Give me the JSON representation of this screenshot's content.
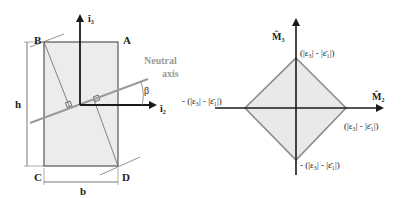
{
  "left_figure": {
    "corners": {
      "A": "A",
      "B": "B",
      "C": "C",
      "D": "D"
    },
    "dimension_h": "h",
    "dimension_b": "b",
    "axis_vertical": "î₃",
    "axis_horizontal": "î₂",
    "neutral_axis_line1": "Neutral",
    "neutral_axis_line2": "axis",
    "angle": "β"
  },
  "right_figure": {
    "axis_vertical": "M̂₃",
    "axis_horizontal": "M̂₂",
    "top_label": "(|ε₃| - |ε̄₁|)",
    "right_label": "(|ε₃| - |ε̄₁|)",
    "bottom_label": "- (|ε₃| - |ε̄₁|)",
    "left_label": "- (|ε₃| - |ε̄₁|)"
  },
  "colors": {
    "section_fill": "#ececec",
    "diamond_fill": "#e9e9e9",
    "neutral_axis": "#9a9a9a",
    "diamond_edge": "#8c8c8c",
    "axis": "#1a1a1a"
  }
}
